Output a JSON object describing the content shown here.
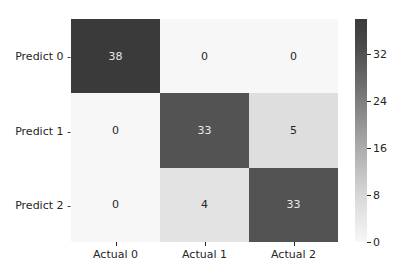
{
  "chart_data": {
    "type": "heatmap",
    "title": "",
    "xlabel": "",
    "ylabel": "",
    "row_labels": [
      "Predict 0",
      "Predict 1",
      "Predict 2"
    ],
    "col_labels": [
      "Actual 0",
      "Actual 1",
      "Actual 2"
    ],
    "values": [
      [
        38,
        0,
        0
      ],
      [
        0,
        33,
        5
      ],
      [
        0,
        4,
        33
      ]
    ],
    "colorbar": {
      "vmin": 0,
      "vmax": 38,
      "ticks": [
        0,
        8,
        16,
        24,
        32
      ]
    },
    "colormap": "greys",
    "annotations": true
  }
}
